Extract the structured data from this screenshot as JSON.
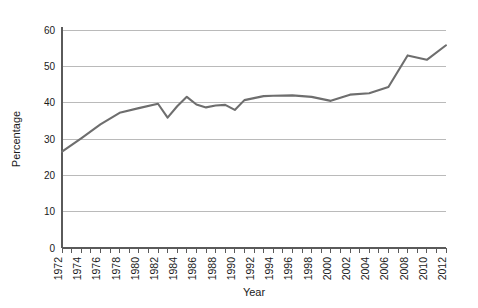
{
  "chart_data": {
    "type": "line",
    "title": "",
    "subtitle": "",
    "xlabel": "Year",
    "ylabel": "Percentage",
    "xlim": [
      1972,
      2012
    ],
    "ylim": [
      0,
      60
    ],
    "yticks": [
      0,
      10,
      20,
      30,
      40,
      50,
      60
    ],
    "ytick_labels": [
      "0",
      "10",
      "20",
      "30",
      "40",
      "50",
      "60"
    ],
    "xticks": [
      1972,
      1973,
      1974,
      1975,
      1976,
      1977,
      1978,
      1979,
      1980,
      1981,
      1982,
      1983,
      1984,
      1985,
      1986,
      1987,
      1988,
      1989,
      1990,
      1991,
      1992,
      1993,
      1994,
      1995,
      1996,
      1997,
      1998,
      1999,
      2000,
      2001,
      2002,
      2003,
      2004,
      2005,
      2006,
      2007,
      2008,
      2009,
      2010,
      2011,
      2012
    ],
    "xtick_labels": [
      "1972",
      "1974",
      "1976",
      "1978",
      "1980",
      "1982",
      "1984",
      "1986",
      "1988",
      "1990",
      "1992",
      "1994",
      "1996",
      "1998",
      "2000",
      "2002",
      "2004",
      "2006",
      "2008",
      "2010",
      "2012"
    ],
    "xtick_label_values": [
      1972,
      1974,
      1976,
      1978,
      1980,
      1982,
      1984,
      1986,
      1988,
      1990,
      1992,
      1994,
      1996,
      1998,
      2000,
      2002,
      2004,
      2006,
      2008,
      2010,
      2012
    ],
    "grid": "horizontal",
    "legend": "none",
    "line_color": "#6e6e6e",
    "grid_color": "#a9a9a9",
    "axis_color": "#5a5a5a",
    "series": [
      {
        "name": "Percentage",
        "x": [
          1972,
          1974,
          1976,
          1978,
          1980,
          1982,
          1983,
          1984,
          1985,
          1986,
          1987,
          1988,
          1989,
          1990,
          1991,
          1993,
          1994,
          1996,
          1998,
          2000,
          2002,
          2004,
          2006,
          2008,
          2010,
          2012
        ],
        "values": [
          26.5,
          30.2,
          34.0,
          37.2,
          38.5,
          39.7,
          35.9,
          39.0,
          41.6,
          39.5,
          38.7,
          39.2,
          39.4,
          38.0,
          40.7,
          41.8,
          41.9,
          42.0,
          41.6,
          40.5,
          42.2,
          42.6,
          44.3,
          53.0,
          51.8,
          55.8
        ]
      }
    ]
  }
}
